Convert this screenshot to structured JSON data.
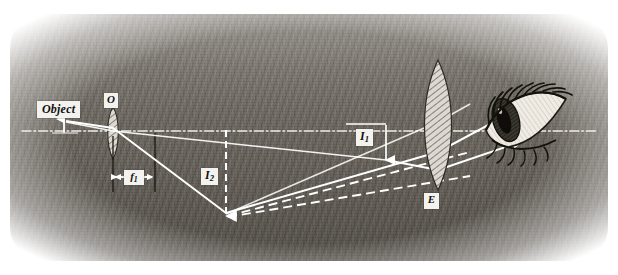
{
  "figure": {
    "kind": "pencil-sketch-optics-ray-diagram",
    "width": 618,
    "height": 275,
    "background_color": "#ffffff",
    "ink_color": "#ffffff",
    "shade_color": "#6b6760",
    "label_box_color": "#f4f2ee",
    "label_text_color": "#111111"
  },
  "labels": {
    "object": "Object",
    "objective_lens": "O",
    "focal_length_1": "f",
    "focal_length_1_sub": "1",
    "image_2": "I",
    "image_2_sub": "2",
    "image_1": "I",
    "image_1_sub": "1",
    "eyepiece_lens": "E"
  },
  "elements": {
    "optical_axis": "dash-dot horizontal axis",
    "object_arrow": "short upward arrow at left on axis",
    "objective": "thin hatched biconvex lens at x=113",
    "eyepiece": "large hatched biconvex lens at x=438",
    "eye": "hand drawn eye with lashes at right",
    "real_image_arrow": "long downward dashed arrow labelled I2",
    "virtual_image_arrow": "short downward arrow labelled I1",
    "focal_dimension": "double-headed arrow between two tick lines labelled f1",
    "solid_rays": 3,
    "dashed_rays": 2
  }
}
